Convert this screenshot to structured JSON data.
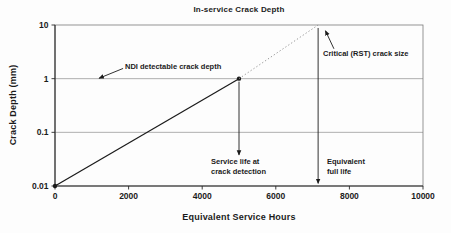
{
  "page": {
    "background": "#fdfdfd",
    "text_color": "#1b1b1b",
    "grid_color": "#8e8e8e",
    "axis_color": "#2a2a2a",
    "border_color": "#7a7a7a"
  },
  "chart_data": {
    "type": "line",
    "title": "In-service Crack Depth",
    "xlabel": "Equivalent Service Hours",
    "ylabel": "Crack Depth (mm)",
    "x_scale": "linear",
    "y_scale": "log",
    "xlim": [
      0,
      10000
    ],
    "ylim": [
      0.01,
      10
    ],
    "x_ticks": [
      0,
      2000,
      4000,
      6000,
      8000,
      10000
    ],
    "y_ticks": [
      0.01,
      0.1,
      1,
      10
    ],
    "grid": "horizontal-only",
    "legend": "none",
    "series": [
      {
        "name": "observed-crack-growth",
        "style": "solid",
        "color": "#1b1b1b",
        "marker": "circle",
        "points": [
          [
            0,
            0.01
          ],
          [
            5000,
            1
          ]
        ]
      },
      {
        "name": "projected-crack-growth",
        "style": "dotted",
        "color": "#8c8c8c",
        "marker": "none",
        "points": [
          [
            5000,
            1
          ],
          [
            7150,
            10
          ]
        ]
      }
    ],
    "annotations": [
      {
        "name": "ndi-detectable",
        "label": "NDI detectable crack depth",
        "arrow_from": [
          1850,
          1.55
        ],
        "arrow_to": [
          1200,
          1.02
        ]
      },
      {
        "name": "critical-rst",
        "label": "Critical (RST) crack size",
        "arrow_from": [
          7580,
          3.6
        ],
        "arrow_to": [
          7350,
          7.8
        ]
      },
      {
        "name": "service-life",
        "label": "Service life at crack detection",
        "arrow_from": [
          5000,
          0.88
        ],
        "arrow_to": [
          5000,
          0.038
        ]
      },
      {
        "name": "full-life",
        "label": "Equivalent full life",
        "arrow_from": [
          7150,
          8.8
        ],
        "arrow_to": [
          7150,
          0.0112
        ]
      }
    ]
  }
}
